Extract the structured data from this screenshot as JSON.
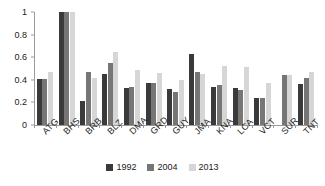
{
  "chart_data": {
    "type": "bar",
    "title": "",
    "subtitle": "",
    "xlabel": "",
    "ylabel": "",
    "ylim": [
      0,
      1
    ],
    "yticks": [
      "0",
      "0.2",
      "0.4",
      "0.6",
      "0.8",
      "1"
    ],
    "ytick_values": [
      0,
      0.2,
      0.4,
      0.6,
      0.8,
      1
    ],
    "grid": false,
    "legend_position": "bottom-center",
    "categories": [
      "ATG",
      "BHS",
      "BRB",
      "BLZ",
      "DMA",
      "GRD",
      "GUY",
      "JMA",
      "KNA",
      "LCA",
      "VCT",
      "SUR",
      "TNT"
    ],
    "series": [
      {
        "name": "1992",
        "color": "#3a3a3a",
        "values": [
          0.41,
          1.0,
          0.21,
          0.45,
          0.33,
          0.37,
          0.32,
          0.63,
          0.34,
          0.33,
          0.24,
          null,
          0.36
        ]
      },
      {
        "name": "2004",
        "color": "#767676",
        "values": [
          0.41,
          1.0,
          0.47,
          0.55,
          0.34,
          0.37,
          0.29,
          0.47,
          0.35,
          0.31,
          0.24,
          0.44,
          0.42
        ]
      },
      {
        "name": "2013",
        "color": "#d6d6d6",
        "values": [
          0.47,
          1.0,
          0.42,
          0.65,
          0.49,
          0.46,
          0.4,
          0.45,
          0.52,
          0.51,
          0.37,
          0.44,
          0.47
        ]
      }
    ]
  }
}
